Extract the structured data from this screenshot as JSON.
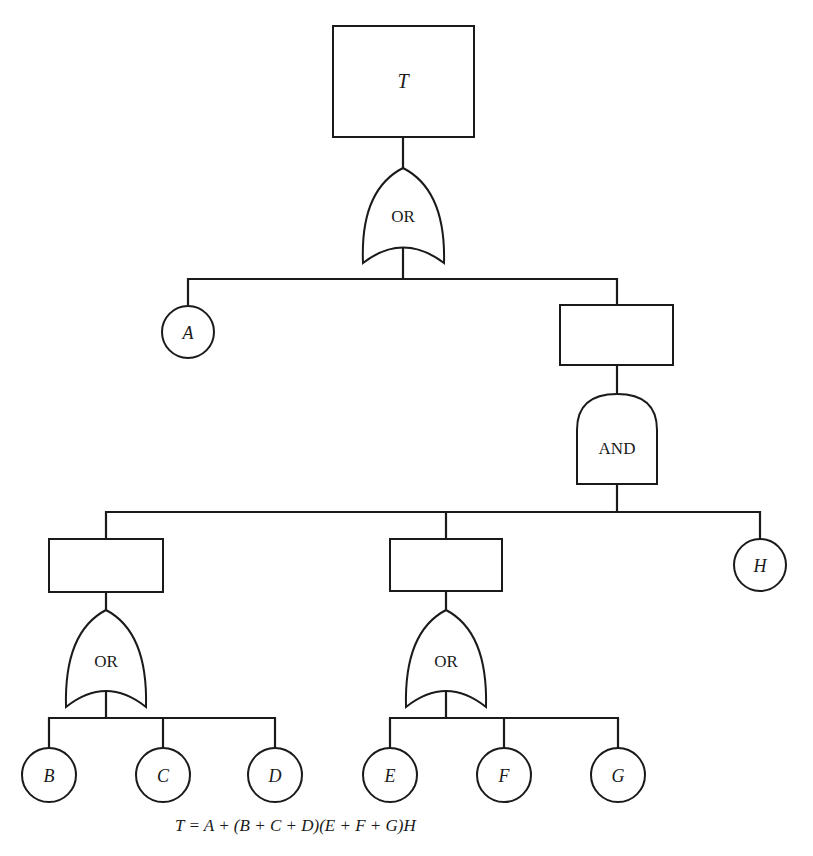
{
  "diagram": {
    "type": "fault-tree",
    "colors": {
      "line": "#1a1a1a",
      "background": "#ffffff"
    },
    "top_event": {
      "label": "T"
    },
    "gates": [
      {
        "id": "g-top",
        "type": "OR",
        "label": "OR"
      },
      {
        "id": "g-and",
        "type": "AND",
        "label": "AND"
      },
      {
        "id": "g-left",
        "type": "OR",
        "label": "OR"
      },
      {
        "id": "g-mid",
        "type": "OR",
        "label": "OR"
      }
    ],
    "intermediate_events": [
      {
        "id": "e-right",
        "label": ""
      },
      {
        "id": "e-left",
        "label": ""
      },
      {
        "id": "e-mid",
        "label": ""
      }
    ],
    "basic_events": [
      {
        "id": "A",
        "label": "A"
      },
      {
        "id": "B",
        "label": "B"
      },
      {
        "id": "C",
        "label": "C"
      },
      {
        "id": "D",
        "label": "D"
      },
      {
        "id": "E",
        "label": "E"
      },
      {
        "id": "F",
        "label": "F"
      },
      {
        "id": "G",
        "label": "G"
      },
      {
        "id": "H",
        "label": "H"
      }
    ],
    "equation": "T = A + (B + C + D)(E + F + G)H"
  }
}
